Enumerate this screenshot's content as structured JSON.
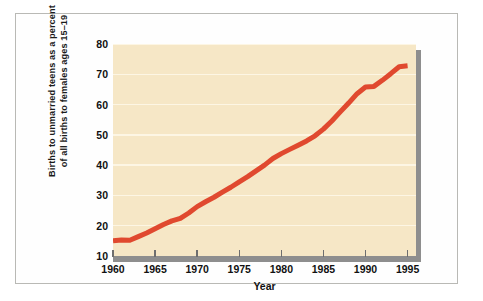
{
  "chart_data": {
    "type": "line",
    "title": "",
    "subtitle": "",
    "xlabel": "Year",
    "ylabel": "Births to unmarried teens as a percent of all births to females ages 15–19",
    "ylabel_lines": [
      "Births to unmarried teens as a percent",
      "of all births to females ages 15–19"
    ],
    "xlim": [
      1960,
      1996
    ],
    "ylim": [
      10,
      80
    ],
    "xticks": [
      1960,
      1965,
      1970,
      1975,
      1980,
      1985,
      1990,
      1995
    ],
    "xtick_labels": [
      "1960",
      "1965",
      "1970",
      "1975",
      "1980",
      "1985",
      "1990",
      "1995"
    ],
    "yticks": [
      10,
      20,
      30,
      40,
      50,
      60,
      70,
      80
    ],
    "ytick_labels": [
      "10",
      "20",
      "30",
      "40",
      "50",
      "60",
      "70",
      "80"
    ],
    "grid": true,
    "grid_axis": "y",
    "legend": false,
    "legend_position": "none",
    "series": [
      {
        "name": "Births to unmarried teens as a percent of all births to females ages 15–19",
        "color": "#e0492f",
        "line_width": 5,
        "x": [
          1960,
          1961,
          1962,
          1963,
          1964,
          1965,
          1966,
          1967,
          1968,
          1969,
          1970,
          1971,
          1972,
          1973,
          1974,
          1975,
          1976,
          1977,
          1978,
          1979,
          1980,
          1981,
          1982,
          1983,
          1984,
          1985,
          1986,
          1987,
          1988,
          1989,
          1990,
          1991,
          1992,
          1993,
          1994,
          1995
        ],
        "values": [
          15.0,
          15.3,
          15.2,
          16.4,
          17.6,
          19.0,
          20.4,
          21.6,
          22.4,
          24.2,
          26.3,
          27.9,
          29.4,
          31.1,
          32.7,
          34.5,
          36.2,
          38.1,
          40.0,
          42.2,
          43.8,
          45.2,
          46.6,
          48.0,
          49.7,
          51.9,
          54.6,
          57.6,
          60.5,
          63.6,
          65.8,
          66.0,
          68.0,
          70.2,
          72.5,
          72.8
        ],
        "marker": "none",
        "style": "solid"
      }
    ],
    "colors": {
      "line": "#e0492f",
      "plot_background": "#f6e7c6",
      "gridline": "#fdf6e4",
      "axis_bar": "#8e8e8e",
      "shadow": "#8e8e8e",
      "frame_border": "#b9b9b5",
      "page_background": "#ffffff",
      "text": "#111111"
    }
  }
}
